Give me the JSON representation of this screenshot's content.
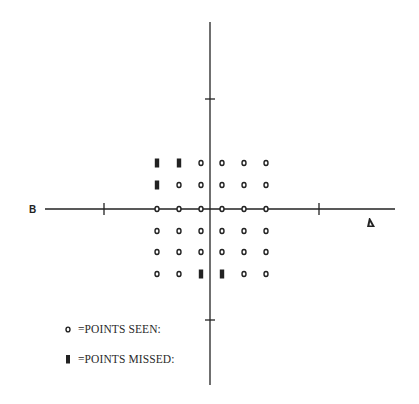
{
  "diagram": {
    "type": "visual-field-plot",
    "axes": {
      "horizontal": {
        "x1": 45,
        "x2": 395,
        "y": 209,
        "ticks_x": [
          104,
          319
        ]
      },
      "vertical": {
        "x": 210,
        "y1": 22,
        "y2": 385,
        "ticks_y": [
          99,
          320
        ]
      }
    },
    "labels": {
      "left": "B",
      "right_marker": "triangle"
    },
    "grid": {
      "columns_x": [
        157,
        179,
        201,
        222,
        244,
        266
      ],
      "rows_y": [
        163,
        185,
        209,
        231,
        252,
        274
      ],
      "points": [
        [
          "missed",
          "missed",
          "seen",
          "seen",
          "seen",
          "seen"
        ],
        [
          "missed",
          "seen",
          "seen",
          "seen",
          "seen",
          "seen"
        ],
        [
          "seen",
          "seen",
          "seen",
          "seen",
          "seen",
          "seen"
        ],
        [
          "seen",
          "seen",
          "seen",
          "seen",
          "seen",
          "seen"
        ],
        [
          "seen",
          "seen",
          "seen",
          "seen",
          "seen",
          "seen"
        ],
        [
          "seen",
          "seen",
          "missed",
          "missed",
          "seen",
          "seen"
        ]
      ]
    },
    "legend": {
      "seen": {
        "symbol": "circle-icon",
        "text": "=POINTS SEEN:"
      },
      "missed": {
        "symbol": "filled-block-icon",
        "text": "=POINTS MISSED:"
      }
    },
    "colors": {
      "ink": "#222222",
      "background": "#ffffff"
    }
  }
}
